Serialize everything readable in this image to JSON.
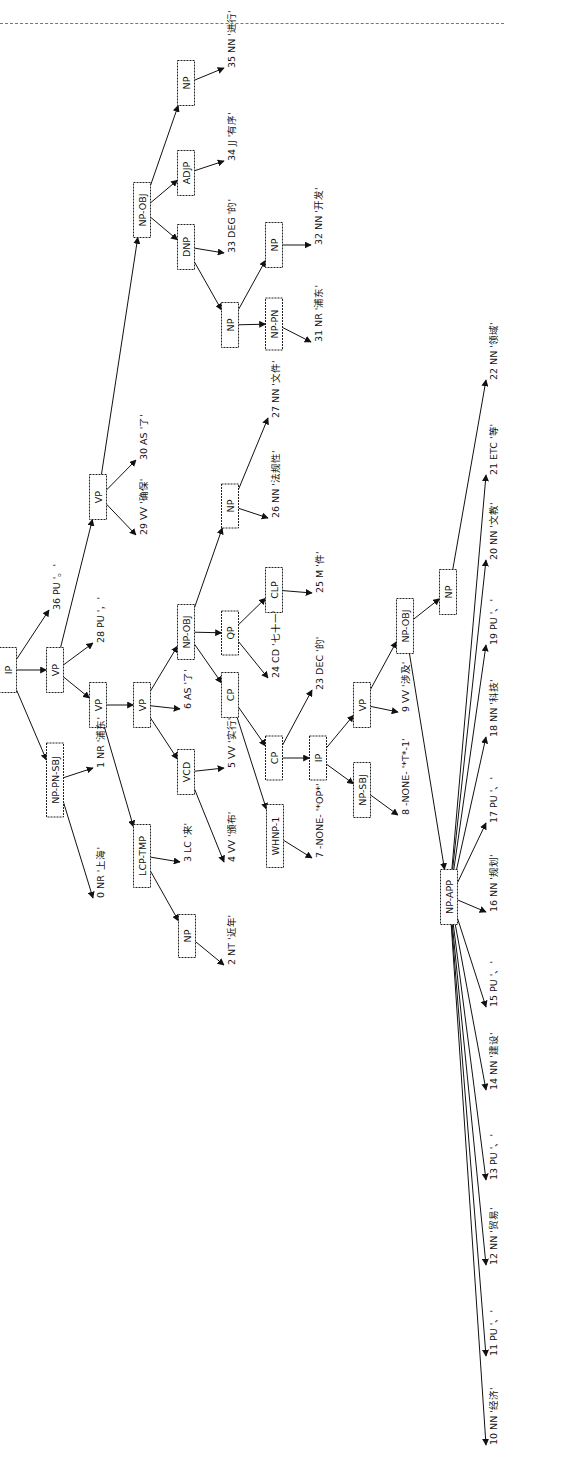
{
  "diagram": {
    "type": "constituency-parse-tree",
    "orientation": "rotated-90-ccw",
    "nodes": [
      {
        "id": "n_ip",
        "label": "IP",
        "x": 8,
        "y": 670,
        "h": 45
      },
      {
        "id": "n_vp1",
        "label": "VP",
        "x": 55,
        "y": 670,
        "h": 45
      },
      {
        "id": "n_npsbj",
        "label": "NP-PN-SBJ",
        "x": 55,
        "y": 780,
        "h": 74
      },
      {
        "id": "n_vp2",
        "label": "VP",
        "x": 98,
        "y": 705,
        "h": 45
      },
      {
        "id": "n_vp_top",
        "label": "VP",
        "x": 98,
        "y": 497,
        "h": 45
      },
      {
        "id": "n_vp3",
        "label": "VP",
        "x": 142,
        "y": 705,
        "h": 45
      },
      {
        "id": "n_lcp",
        "label": "LCP-TMP",
        "x": 142,
        "y": 856,
        "h": 63
      },
      {
        "id": "n_npobj_top",
        "label": "NP-OBJ",
        "x": 142,
        "y": 210,
        "h": 55
      },
      {
        "id": "n_vcd",
        "label": "VCD",
        "x": 186,
        "y": 772,
        "h": 45
      },
      {
        "id": "n_npobj_mid",
        "label": "NP-OBJ",
        "x": 186,
        "y": 632,
        "h": 55
      },
      {
        "id": "n_np_2",
        "label": "NP",
        "x": 187,
        "y": 936,
        "h": 43
      },
      {
        "id": "n_np_35",
        "label": "NP",
        "x": 186,
        "y": 83,
        "h": 45
      },
      {
        "id": "n_adjp",
        "label": "ADJP",
        "x": 186,
        "y": 173,
        "h": 45
      },
      {
        "id": "n_dnp",
        "label": "DNP",
        "x": 186,
        "y": 247,
        "h": 45
      },
      {
        "id": "n_qp",
        "label": "QP",
        "x": 230,
        "y": 633,
        "h": 44
      },
      {
        "id": "n_cp_up",
        "label": "CP",
        "x": 230,
        "y": 695,
        "h": 45
      },
      {
        "id": "n_np_26",
        "label": "NP",
        "x": 230,
        "y": 506,
        "h": 44
      },
      {
        "id": "n_np_dnp",
        "label": "NP",
        "x": 230,
        "y": 325,
        "h": 45
      },
      {
        "id": "n_clp",
        "label": "CLP",
        "x": 274,
        "y": 590,
        "h": 45
      },
      {
        "id": "n_cp_low",
        "label": "CP",
        "x": 274,
        "y": 758,
        "h": 44
      },
      {
        "id": "n_whnp",
        "label": "WHNP-1",
        "x": 275,
        "y": 836,
        "h": 63
      },
      {
        "id": "n_nppn",
        "label": "NP-PN",
        "x": 274,
        "y": 324,
        "h": 52
      },
      {
        "id": "n_np_32",
        "label": "NP",
        "x": 274,
        "y": 245,
        "h": 45
      },
      {
        "id": "n_ip_in",
        "label": "IP",
        "x": 318,
        "y": 758,
        "h": 44
      },
      {
        "id": "n_vp_in",
        "label": "VP",
        "x": 362,
        "y": 705,
        "h": 45
      },
      {
        "id": "n_npsbj_in",
        "label": "NP-SBJ",
        "x": 362,
        "y": 790,
        "h": 55
      },
      {
        "id": "n_npobj_in",
        "label": "NP-OBJ",
        "x": 405,
        "y": 626,
        "h": 55
      },
      {
        "id": "n_np_in",
        "label": "NP",
        "x": 448,
        "y": 592,
        "h": 45
      },
      {
        "id": "n_npapp",
        "label": "NP-APP",
        "x": 449,
        "y": 897,
        "h": 55
      }
    ],
    "leaves": [
      {
        "id": "w0",
        "label": "0 NR '上海'",
        "x": 100,
        "y": 898
      },
      {
        "id": "w1",
        "label": "1 NR '浦东'",
        "x": 100,
        "y": 768
      },
      {
        "id": "w2",
        "label": "2 NT '近年'",
        "x": 231,
        "y": 965
      },
      {
        "id": "w3",
        "label": "3 LC '来'",
        "x": 187,
        "y": 862
      },
      {
        "id": "w4",
        "label": "4 VV '颁布'",
        "x": 231,
        "y": 862
      },
      {
        "id": "w5",
        "label": "5 VV '实行'",
        "x": 231,
        "y": 768
      },
      {
        "id": "w6",
        "label": "6 AS '了'",
        "x": 187,
        "y": 709
      },
      {
        "id": "w7",
        "label": "7 -NONE- '*OP*'",
        "x": 319,
        "y": 858
      },
      {
        "id": "w8",
        "label": "8 -NONE- '*T*-1'",
        "x": 405,
        "y": 815
      },
      {
        "id": "w9",
        "label": "9 VV '涉及'",
        "x": 405,
        "y": 712
      },
      {
        "id": "w10",
        "label": "10 NN '经济'",
        "x": 493,
        "y": 1445
      },
      {
        "id": "w11",
        "label": "11 PU '、'",
        "x": 493,
        "y": 1356
      },
      {
        "id": "w12",
        "label": "12 NN '贸易'",
        "x": 493,
        "y": 1265
      },
      {
        "id": "w13",
        "label": "13 PU '、'",
        "x": 493,
        "y": 1180
      },
      {
        "id": "w14",
        "label": "14 NN '建设'",
        "x": 493,
        "y": 1090
      },
      {
        "id": "w15",
        "label": "15 PU '、'",
        "x": 493,
        "y": 1007
      },
      {
        "id": "w16",
        "label": "16 NN '规划'",
        "x": 493,
        "y": 912
      },
      {
        "id": "w17",
        "label": "17 PU '、'",
        "x": 493,
        "y": 823
      },
      {
        "id": "w18",
        "label": "18 NN '科技'",
        "x": 493,
        "y": 737
      },
      {
        "id": "w19",
        "label": "19 PU '、'",
        "x": 493,
        "y": 645
      },
      {
        "id": "w20",
        "label": "20 NN '文教'",
        "x": 493,
        "y": 560
      },
      {
        "id": "w21",
        "label": "21 ETC '等'",
        "x": 493,
        "y": 475
      },
      {
        "id": "w22",
        "label": "22 NN '领域'",
        "x": 493,
        "y": 380
      },
      {
        "id": "w23",
        "label": "23 DEC '的'",
        "x": 319,
        "y": 690
      },
      {
        "id": "w24",
        "label": "24 CD '七十一'",
        "x": 275,
        "y": 678
      },
      {
        "id": "w25",
        "label": "25 M '件'",
        "x": 319,
        "y": 593
      },
      {
        "id": "w26",
        "label": "26 NN '法规性'",
        "x": 275,
        "y": 518
      },
      {
        "id": "w27",
        "label": "27 NN '文件'",
        "x": 275,
        "y": 418
      },
      {
        "id": "w28",
        "label": "28 PU '，'",
        "x": 100,
        "y": 643
      },
      {
        "id": "w29",
        "label": "29 VV '确保'",
        "x": 143,
        "y": 535
      },
      {
        "id": "w30",
        "label": "30 AS '了'",
        "x": 143,
        "y": 460
      },
      {
        "id": "w31",
        "label": "31 NR '浦东'",
        "x": 318,
        "y": 342
      },
      {
        "id": "w32",
        "label": "32 NN '开发'",
        "x": 318,
        "y": 245
      },
      {
        "id": "w33",
        "label": "33 DEG '的'",
        "x": 231,
        "y": 253
      },
      {
        "id": "w34",
        "label": "34 JJ '有序'",
        "x": 231,
        "y": 161
      },
      {
        "id": "w35",
        "label": "35 NN '进行'",
        "x": 231,
        "y": 68
      },
      {
        "id": "w36",
        "label": "36 PU '。'",
        "x": 56,
        "y": 610
      }
    ],
    "edges": [
      [
        "n_ip",
        "n_vp1"
      ],
      [
        "n_ip",
        "n_npsbj"
      ],
      [
        "n_ip",
        "w36"
      ],
      [
        "n_npsbj",
        "w0"
      ],
      [
        "n_npsbj",
        "w1"
      ],
      [
        "n_vp1",
        "n_vp2"
      ],
      [
        "n_vp1",
        "w28"
      ],
      [
        "n_vp1",
        "n_vp_top"
      ],
      [
        "n_vp_top",
        "w29"
      ],
      [
        "n_vp_top",
        "w30"
      ],
      [
        "n_vp_top",
        "n_npobj_top"
      ],
      [
        "n_npobj_top",
        "n_dnp"
      ],
      [
        "n_npobj_top",
        "n_adjp"
      ],
      [
        "n_npobj_top",
        "n_np_35"
      ],
      [
        "n_np_35",
        "w35"
      ],
      [
        "n_adjp",
        "w34"
      ],
      [
        "n_dnp",
        "w33"
      ],
      [
        "n_dnp",
        "n_np_dnp"
      ],
      [
        "n_np_dnp",
        "n_nppn"
      ],
      [
        "n_np_dnp",
        "n_np_32"
      ],
      [
        "n_nppn",
        "w31"
      ],
      [
        "n_np_32",
        "w32"
      ],
      [
        "n_vp2",
        "n_lcp"
      ],
      [
        "n_vp2",
        "n_vp3"
      ],
      [
        "n_lcp",
        "w3"
      ],
      [
        "n_lcp",
        "n_np_2"
      ],
      [
        "n_np_2",
        "w2"
      ],
      [
        "n_vp3",
        "n_vcd"
      ],
      [
        "n_vp3",
        "w6"
      ],
      [
        "n_vp3",
        "n_npobj_mid"
      ],
      [
        "n_vcd",
        "w5"
      ],
      [
        "n_vcd",
        "w4"
      ],
      [
        "n_npobj_mid",
        "n_cp_up"
      ],
      [
        "n_npobj_mid",
        "n_qp"
      ],
      [
        "n_npobj_mid",
        "n_np_26"
      ],
      [
        "n_qp",
        "w24"
      ],
      [
        "n_qp",
        "n_clp"
      ],
      [
        "n_clp",
        "w25"
      ],
      [
        "n_np_26",
        "w26"
      ],
      [
        "n_np_26",
        "w27"
      ],
      [
        "n_cp_up",
        "n_whnp"
      ],
      [
        "n_cp_up",
        "n_cp_low"
      ],
      [
        "n_whnp",
        "w7"
      ],
      [
        "n_cp_low",
        "n_ip_in"
      ],
      [
        "n_cp_low",
        "w23"
      ],
      [
        "n_ip_in",
        "n_npsbj_in"
      ],
      [
        "n_ip_in",
        "n_vp_in"
      ],
      [
        "n_npsbj_in",
        "w8"
      ],
      [
        "n_vp_in",
        "w9"
      ],
      [
        "n_vp_in",
        "n_npobj_in"
      ],
      [
        "n_npobj_in",
        "n_npapp"
      ],
      [
        "n_npobj_in",
        "n_np_in"
      ],
      [
        "n_np_in",
        "w22"
      ],
      [
        "n_npapp",
        "w10"
      ],
      [
        "n_npapp",
        "w11"
      ],
      [
        "n_npapp",
        "w12"
      ],
      [
        "n_npapp",
        "w13"
      ],
      [
        "n_npapp",
        "w14"
      ],
      [
        "n_npapp",
        "w15"
      ],
      [
        "n_npapp",
        "w16"
      ],
      [
        "n_npapp",
        "w17"
      ],
      [
        "n_npapp",
        "w18"
      ],
      [
        "n_npapp",
        "w19"
      ],
      [
        "n_npapp",
        "w20"
      ],
      [
        "n_npapp",
        "w21"
      ]
    ]
  }
}
